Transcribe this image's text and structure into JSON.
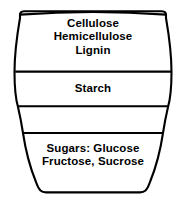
{
  "diagram": {
    "shape": "shield-barrel",
    "stroke_color": "#000000",
    "fill_color": "#ffffff",
    "text_color": "#000000",
    "bands": [
      {
        "id": "band-1",
        "name": "structural-polysaccharides",
        "lines": [
          "Cellulose",
          "Hemicellulose",
          "Lignin"
        ],
        "line1": "Cellulose",
        "line2": "Hemicellulose",
        "line3": "Lignin"
      },
      {
        "id": "band-2",
        "name": "storage-polysaccharide",
        "lines": [
          "Starch"
        ],
        "line1": "Starch"
      },
      {
        "id": "band-3",
        "name": "unlabeled-band",
        "lines": []
      },
      {
        "id": "band-4",
        "name": "simple-sugars",
        "lines": [
          "Sugars: Glucose",
          "Fructose, Sucrose"
        ],
        "line1": "Sugars: Glucose",
        "line2": "Fructose, Sucrose"
      }
    ],
    "divider_count": 3
  }
}
